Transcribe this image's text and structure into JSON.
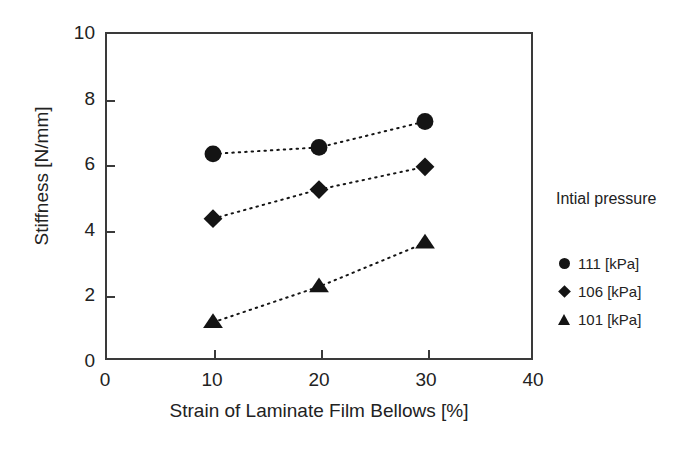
{
  "chart_data": {
    "type": "scatter",
    "title": "",
    "xlabel": "Strain of Laminate Film Bellows [%]",
    "ylabel": "Stiffness [N/mm]",
    "xlim": [
      0,
      40
    ],
    "ylim": [
      0,
      10
    ],
    "xticks": [
      0,
      10,
      20,
      30,
      40
    ],
    "yticks": [
      0,
      2,
      4,
      6,
      8,
      10
    ],
    "xtick_labels": [
      "0",
      "10",
      "20",
      "30",
      "40"
    ],
    "ytick_labels": [
      "0",
      "2",
      "4",
      "6",
      "8",
      "10"
    ],
    "grid": false,
    "legend_position": "right",
    "legend_title": "Intial pressure",
    "x": [
      10,
      20,
      30
    ],
    "series": [
      {
        "name": "111 [kPa]",
        "marker": "circle",
        "color": "#141414",
        "line": "dotted",
        "values": [
          6.3,
          6.5,
          7.3
        ]
      },
      {
        "name": "106 [kPa]",
        "marker": "diamond",
        "color": "#141414",
        "line": "dotted",
        "values": [
          4.3,
          5.2,
          5.9
        ]
      },
      {
        "name": "101 [kPa]",
        "marker": "triangle",
        "color": "#141414",
        "line": "dotted",
        "values": [
          1.1,
          2.2,
          3.55
        ]
      }
    ]
  },
  "axes": {
    "frame_color": "#3a3a3a"
  }
}
